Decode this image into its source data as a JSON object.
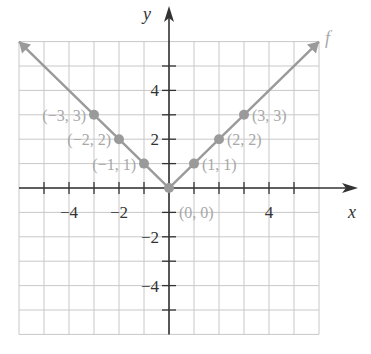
{
  "chart_data": {
    "type": "line",
    "title": "",
    "xlabel": "x",
    "ylabel": "y",
    "function_label": "f",
    "xlim": [
      -6,
      6
    ],
    "ylim": [
      -6,
      6
    ],
    "grid": true,
    "x_tick_labels": [
      "-4",
      "-2",
      "4"
    ],
    "y_tick_labels": [
      "4",
      "2",
      "-2",
      "-4"
    ],
    "series": [
      {
        "name": "f",
        "x": [
          -6,
          -3,
          -2,
          -1,
          0,
          1,
          2,
          3,
          6
        ],
        "y": [
          6,
          3,
          2,
          1,
          0,
          1,
          2,
          3,
          6
        ]
      }
    ],
    "points": [
      {
        "x": -3,
        "y": 3,
        "label": "(−3, 3)"
      },
      {
        "x": -2,
        "y": 2,
        "label": "(−2, 2)"
      },
      {
        "x": -1,
        "y": 1,
        "label": "(−1, 1)"
      },
      {
        "x": 0,
        "y": 0,
        "label": "(0, 0)"
      },
      {
        "x": 1,
        "y": 1,
        "label": "(1, 1)"
      },
      {
        "x": 2,
        "y": 2,
        "label": "(2, 2)"
      },
      {
        "x": 3,
        "y": 3,
        "label": "(3, 3)"
      }
    ],
    "colors": {
      "graph": "#9a9a9a",
      "axes": "#333333",
      "grid": "#c8c8c8",
      "labels": "#a8a8a8"
    }
  }
}
